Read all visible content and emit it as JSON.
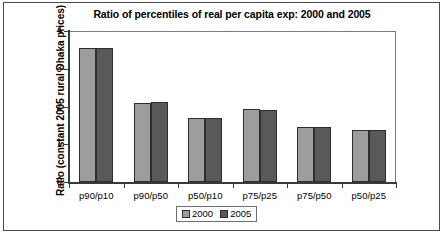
{
  "chart_data": {
    "type": "bar",
    "title": "Ratio of percentiles of real per capita exp: 2000 and 2005",
    "xlabel": "",
    "ylabel": "Ratio (constant 2005 rural Dhaka prices)",
    "categories": [
      "p90/p10",
      "p90/p50",
      "p50/p10",
      "p75/p25",
      "p75/p50",
      "p50/p25"
    ],
    "series": [
      {
        "name": "2000",
        "color": "#9d9d9d",
        "values": [
          3.55,
          2.09,
          1.7,
          1.94,
          1.46,
          1.38
        ]
      },
      {
        "name": "2005",
        "color": "#595959",
        "values": [
          3.55,
          2.11,
          1.7,
          1.91,
          1.45,
          1.38
        ]
      }
    ],
    "ylim": [
      0,
      4
    ],
    "yticks": [
      "0",
      "1",
      "2",
      "3",
      "4"
    ],
    "grid": false,
    "legend_position": "bottom"
  }
}
